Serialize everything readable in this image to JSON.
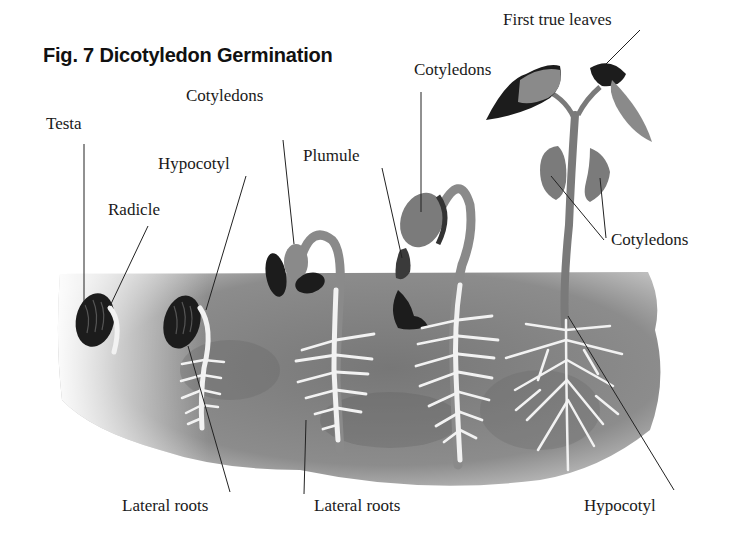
{
  "title": "Fig. 7 Dicotyledon Germination",
  "labels": {
    "testa": "Testa",
    "radicle": "Radicle",
    "hypocotyl_top": "Hypocotyl",
    "cotyledons_stage3": "Cotyledons",
    "plumule": "Plumule",
    "cotyledons_stage4": "Cotyledons",
    "first_true_leaves": "First true leaves",
    "cotyledons_stage5": "Cotyledons",
    "lateral_roots_1": "Lateral roots",
    "lateral_roots_2": "Lateral roots",
    "hypocotyl_bottom": "Hypocotyl"
  },
  "colors": {
    "soil": "#8a8a8a",
    "soil_dark": "#6f6f6f",
    "seed": "#1c1c1c",
    "cotyledon": "#7b7b7b",
    "root": "#f4f4f4",
    "leader_line": "#222222"
  }
}
